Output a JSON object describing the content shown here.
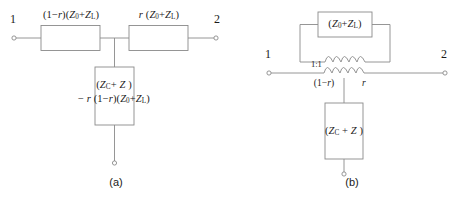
{
  "figure": {
    "background_color": "#ffffff",
    "line_color": "#8a8a8a",
    "text_color": "#1a1a1a"
  },
  "panel_a": {
    "caption": "(a)",
    "terminal_left": "1",
    "terminal_right": "2",
    "series_left_label_html": "(1&minus;<i>r</i>)(<i>Z</i><sub>0</sub>+<i>Z</i><sub>L</sub>)",
    "series_left_label_text": "(1-r)(Z0+ZL)",
    "series_right_label_html": "<i>r</i> (<i>Z</i><sub>0</sub>+<i>Z</i><sub>L</sub>)",
    "series_right_label_text": "r (Z0+ZL)",
    "shunt_label_line1_html": "(<i>Z</i><sub>C</sub>+ <i>Z</i> )",
    "shunt_label_line1_text": "(ZC+ Z )",
    "shunt_label_line2_html": "&minus; <i>r</i> (1&minus;<i>r</i>)(<i>Z</i><sub>0</sub>+<i>Z</i><sub>L</sub>)",
    "shunt_label_line2_text": "- r (1-r)(Z0+ZL)"
  },
  "panel_b": {
    "caption": "(b)",
    "terminal_left": "1",
    "terminal_right": "2",
    "top_box_label_html": "(<i>Z</i><sub>0</sub>+<i>Z</i><sub>L</sub>)",
    "top_box_label_text": "(Z0+ZL)",
    "transformer_ratio": "1:1",
    "winding_left_label_html": "(1&minus;<i>r</i>)",
    "winding_left_label_text": "(1-r)",
    "winding_right_label_html": "<i>r</i>",
    "winding_right_label_text": "r",
    "shunt_box_label_html": "(<i>Z</i><sub>C</sub> + <i>Z</i> )",
    "shunt_box_label_text": "(ZC + Z )"
  }
}
